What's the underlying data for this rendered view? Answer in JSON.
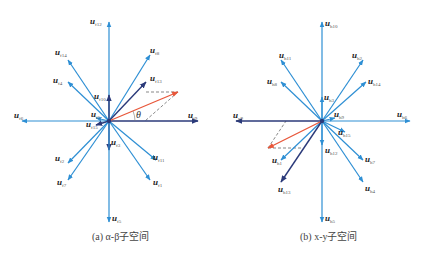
{
  "colors": {
    "light_vector": "#2e8fd4",
    "dark_vector": "#2b3a7a",
    "reference_vector": "#e8573a",
    "dashed": "#555555"
  },
  "panels": [
    {
      "id": "alpha-beta",
      "caption": "(a) α-β子空间",
      "center": [
        109,
        121
      ],
      "angle_label": "θ",
      "vectors": [
        {
          "name": "u_f12",
          "sub": "f12",
          "to": [
            109,
            22
          ],
          "style": "light",
          "label_at": [
            90,
            24
          ]
        },
        {
          "name": "u_f14",
          "sub": "f14",
          "to": [
            68,
            60
          ],
          "style": "light",
          "label_at": [
            55,
            55
          ]
        },
        {
          "name": "u_f4",
          "sub": "f4",
          "to": [
            68,
            82
          ],
          "style": "light",
          "label_at": [
            53,
            83
          ]
        },
        {
          "name": "u_f10",
          "sub": "f10",
          "to": [
            109,
            95
          ],
          "style": "dark",
          "label_at": [
            94,
            99
          ]
        },
        {
          "name": "u_f8",
          "sub": "f8",
          "to": [
            150,
            55
          ],
          "style": "light",
          "label_at": [
            150,
            53
          ]
        },
        {
          "name": "u_f13",
          "sub": "f13",
          "to": [
            146,
            82
          ],
          "style": "dark",
          "label_at": [
            150,
            81
          ]
        },
        {
          "name": "u_f9",
          "sub": "f9",
          "to": [
            198,
            121
          ],
          "style": "dark",
          "label_at": [
            188,
            118
          ]
        },
        {
          "name": "u_f6",
          "sub": "f6",
          "to": [
            22,
            121
          ],
          "style": "light",
          "label_at": [
            14,
            118
          ]
        },
        {
          "name": "u_f5_short",
          "sub": "f5",
          "to": [
            96,
            118
          ],
          "style": "light",
          "label_at": [
            91,
            117
          ]
        },
        {
          "name": "u_f15",
          "sub": "f15",
          "to": [
            96,
            125
          ],
          "style": "dark",
          "label_at": [
            86,
            127
          ]
        },
        {
          "name": "u_f3",
          "sub": "f3",
          "to": [
            109,
            150
          ],
          "style": "dark",
          "label_at": [
            111,
            145
          ]
        },
        {
          "name": "u_f2",
          "sub": "f2",
          "to": [
            68,
            163
          ],
          "style": "light",
          "label_at": [
            55,
            161
          ]
        },
        {
          "name": "u_f7",
          "sub": "f7",
          "to": [
            68,
            180
          ],
          "style": "light",
          "label_at": [
            57,
            185
          ]
        },
        {
          "name": "u_f11",
          "sub": "f11",
          "to": [
            156,
            160
          ],
          "style": "light",
          "label_at": [
            153,
            160
          ]
        },
        {
          "name": "u_f1",
          "sub": "f1",
          "to": [
            150,
            180
          ],
          "style": "light",
          "label_at": [
            153,
            185
          ]
        },
        {
          "name": "u_f5",
          "sub": "f5",
          "to": [
            109,
            222
          ],
          "style": "light",
          "label_at": [
            112,
            221
          ]
        }
      ],
      "reference": {
        "to": [
          178,
          92
        ]
      },
      "dashed": [
        [
          [
            146,
            92
          ],
          [
            178,
            92
          ]
        ],
        [
          [
            178,
            92
          ],
          [
            145,
            121
          ]
        ]
      ]
    },
    {
      "id": "x-y",
      "caption": "(b) x-y子空间",
      "center": [
        322,
        121
      ],
      "vectors": [
        {
          "name": "u_h10",
          "sub": "h10",
          "to": [
            322,
            22
          ],
          "style": "light",
          "label_at": [
            325,
            26
          ]
        },
        {
          "name": "u_h11",
          "sub": "h11",
          "to": [
            281,
            60
          ],
          "style": "light",
          "label_at": [
            279,
            58
          ]
        },
        {
          "name": "u_h8",
          "sub": "h8",
          "to": [
            281,
            82
          ],
          "style": "light",
          "label_at": [
            267,
            84
          ]
        },
        {
          "name": "u_h3",
          "sub": "h3",
          "to": [
            322,
            97
          ],
          "style": "light",
          "label_at": [
            324,
            100
          ]
        },
        {
          "name": "u_h2",
          "sub": "h2",
          "to": [
            363,
            60
          ],
          "style": "light",
          "label_at": [
            352,
            58
          ]
        },
        {
          "name": "u_h14",
          "sub": "h14",
          "to": [
            366,
            82
          ],
          "style": "light",
          "label_at": [
            368,
            84
          ]
        },
        {
          "name": "u_h9",
          "sub": "h9",
          "to": [
            335,
            118
          ],
          "style": "light",
          "label_at": [
            334,
            117
          ]
        },
        {
          "name": "u_h6",
          "sub": "h6",
          "to": [
            410,
            121
          ],
          "style": "light",
          "label_at": [
            397,
            117
          ]
        },
        {
          "name": "u_y9",
          "sub": "y9",
          "to": [
            236,
            121
          ],
          "style": "dark",
          "label_at": [
            233,
            118
          ]
        },
        {
          "name": "u_h15",
          "sub": "h15",
          "to": [
            345,
            132
          ],
          "style": "light",
          "label_at": [
            338,
            135
          ]
        },
        {
          "name": "u_h12",
          "sub": "h12",
          "to": [
            322,
            145
          ],
          "style": "light",
          "label_at": [
            325,
            153
          ]
        },
        {
          "name": "u_h1",
          "sub": "h1",
          "to": [
            281,
            160
          ],
          "style": "light",
          "label_at": [
            272,
            163
          ]
        },
        {
          "name": "u_h13",
          "sub": "h13",
          "to": [
            281,
            182
          ],
          "style": "dark",
          "label_at": [
            278,
            192
          ]
        },
        {
          "name": "u_h7",
          "sub": "h7",
          "to": [
            363,
            160
          ],
          "style": "light",
          "label_at": [
            365,
            162
          ]
        },
        {
          "name": "u_h4",
          "sub": "h4",
          "to": [
            363,
            182
          ],
          "style": "light",
          "label_at": [
            365,
            191
          ]
        },
        {
          "name": "u_h5",
          "sub": "h5",
          "to": [
            322,
            222
          ],
          "style": "light",
          "label_at": [
            325,
            221
          ]
        }
      ],
      "reference": {
        "to": [
          268,
          148
        ]
      },
      "dashed": [
        [
          [
            268,
            148
          ],
          [
            303,
            148
          ]
        ],
        [
          [
            268,
            148
          ],
          [
            286,
            121
          ]
        ]
      ]
    }
  ]
}
